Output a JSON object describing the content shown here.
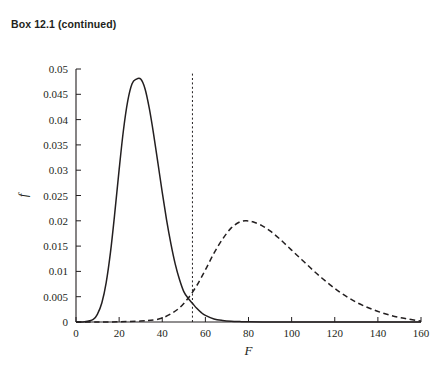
{
  "caption": "Box 12.1 (continued)",
  "chart_data": {
    "type": "line",
    "title": "",
    "subtitle": "",
    "xlabel": "F",
    "ylabel": "f",
    "xlim": [
      0,
      160
    ],
    "ylim": [
      0,
      0.05
    ],
    "grid": false,
    "legend": "none",
    "x_ticks": [
      0,
      20,
      40,
      60,
      80,
      100,
      120,
      140,
      160
    ],
    "x_tick_labels": [
      "0",
      "20",
      "40",
      "60",
      "80",
      "100",
      "120",
      "140",
      "160"
    ],
    "y_ticks": [
      0,
      0.005,
      0.01,
      0.015,
      0.02,
      0.025,
      0.03,
      0.035,
      0.04,
      0.045,
      0.05
    ],
    "y_tick_labels": [
      "0",
      "0.005",
      "0.01",
      "0.015",
      "0.02",
      "0.025",
      "0.03",
      "0.035",
      "0.04",
      "0.045",
      "0.05"
    ],
    "annotations": [
      {
        "name": "critical-value-line",
        "type": "vline",
        "x": 54,
        "style": "dashed",
        "y_top": 0.0494,
        "y_bottom": 0
      }
    ],
    "series": [
      {
        "name": "null-distribution",
        "style": "solid",
        "color": "#231f20",
        "peak_x": 30,
        "peak_y": 0.048,
        "x": [
          0,
          4,
          8,
          10,
          12,
          14,
          16,
          18,
          20,
          22,
          24,
          26,
          28,
          30,
          32,
          34,
          36,
          38,
          40,
          42,
          44,
          46,
          48,
          50,
          52,
          54,
          56,
          58,
          60,
          64,
          68,
          72,
          76,
          80,
          90,
          100,
          120,
          140,
          160
        ],
        "y": [
          0,
          3e-05,
          0.0005,
          0.0016,
          0.0038,
          0.0078,
          0.0138,
          0.0216,
          0.0301,
          0.0379,
          0.0437,
          0.0471,
          0.048,
          0.048,
          0.0461,
          0.0422,
          0.0371,
          0.0314,
          0.0256,
          0.0202,
          0.0155,
          0.0115,
          0.0084,
          0.006,
          0.0047,
          0.0037,
          0.0027,
          0.0019,
          0.0013,
          0.0006,
          0.0003,
          0.00015,
          8e-05,
          4e-05,
          1e-05,
          5e-06,
          0,
          0,
          0
        ]
      },
      {
        "name": "alternative-distribution",
        "style": "dashed",
        "color": "#231f20",
        "peak_x": 79,
        "peak_y": 0.02,
        "x": [
          0,
          10,
          20,
          30,
          36,
          40,
          44,
          48,
          52,
          56,
          60,
          64,
          68,
          72,
          76,
          79,
          82,
          86,
          90,
          94,
          98,
          102,
          106,
          110,
          114,
          118,
          122,
          126,
          130,
          134,
          138,
          142,
          146,
          150,
          154,
          158,
          160
        ],
        "y": [
          0,
          0,
          4e-05,
          0.00018,
          0.0004,
          0.0008,
          0.0016,
          0.0028,
          0.0047,
          0.0072,
          0.0103,
          0.0136,
          0.0164,
          0.0186,
          0.0198,
          0.02,
          0.0198,
          0.0191,
          0.018,
          0.0166,
          0.015,
          0.0134,
          0.0118,
          0.0102,
          0.0087,
          0.0073,
          0.006,
          0.0049,
          0.0039,
          0.0031,
          0.0024,
          0.0018,
          0.0013,
          0.0009,
          0.0006,
          0.0003,
          0.0002
        ]
      }
    ]
  }
}
